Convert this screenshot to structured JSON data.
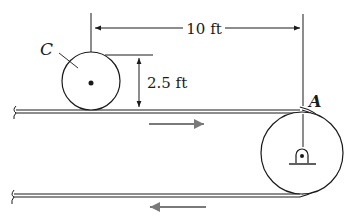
{
  "diagram": {
    "type": "mechanics-conveyor",
    "labels": {
      "cylinder": "C",
      "pulley": "A",
      "horizontal_distance": "10 ft",
      "cylinder_height": "2.5 ft"
    },
    "colors": {
      "line": "#1a1a1a",
      "motion_arrow": "#7a7a7a",
      "background": "#ffffff"
    },
    "motion": {
      "top_belt_direction": "right",
      "bottom_belt_direction": "left"
    }
  }
}
